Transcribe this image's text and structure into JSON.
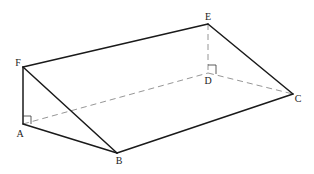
{
  "diagram": {
    "type": "triangular prism",
    "vertices": {
      "A": {
        "label": "A",
        "x": 23,
        "y": 124
      },
      "B": {
        "label": "B",
        "x": 117,
        "y": 153
      },
      "C": {
        "label": "C",
        "x": 293,
        "y": 94
      },
      "D": {
        "label": "D",
        "x": 208,
        "y": 73
      },
      "E": {
        "label": "E",
        "x": 208,
        "y": 24
      },
      "F": {
        "label": "F",
        "x": 23,
        "y": 67
      }
    },
    "visible_edges": [
      "FA",
      "FB",
      "AB",
      "FE",
      "EC",
      "BC"
    ],
    "hidden_edges": [
      "AD",
      "DC",
      "ED"
    ],
    "right_angles": [
      "FAD",
      "EDC"
    ],
    "colors": {
      "edge": "#1a1a1a",
      "hidden_edge": "#8a8a8a"
    }
  }
}
